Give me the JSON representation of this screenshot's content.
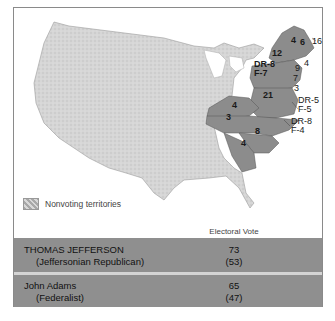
{
  "map": {
    "title": "Election of 1800 electoral map",
    "state_labels": [
      {
        "id": "nh",
        "text": "4",
        "x": 284,
        "y": 33
      },
      {
        "id": "me-ma",
        "text": "6",
        "x": 296,
        "y": 35
      },
      {
        "id": "ma",
        "text": "16",
        "x": 308,
        "y": 34
      },
      {
        "id": "ny",
        "text": "12",
        "x": 269,
        "y": 44
      },
      {
        "id": "ri",
        "text": "4",
        "x": 312,
        "y": 55
      },
      {
        "id": "ct",
        "text": "9",
        "x": 297,
        "y": 59
      },
      {
        "id": "pa",
        "text": "DR-8",
        "x": 258,
        "y": 63
      },
      {
        "id": "pa2",
        "text": "F-7",
        "x": 258,
        "y": 71
      },
      {
        "id": "nj",
        "text": "7",
        "x": 292,
        "y": 69
      },
      {
        "id": "de",
        "text": "3",
        "x": 290,
        "y": 80
      },
      {
        "id": "va",
        "text": "21",
        "x": 261,
        "y": 88
      },
      {
        "id": "md",
        "text": "DR-5",
        "x": 292,
        "y": 95
      },
      {
        "id": "md2",
        "text": "F-5",
        "x": 292,
        "y": 104
      },
      {
        "id": "ky",
        "text": "4",
        "x": 230,
        "y": 97
      },
      {
        "id": "tn",
        "text": "3",
        "x": 223,
        "y": 108
      },
      {
        "id": "nc",
        "text": "DR-8",
        "x": 285,
        "y": 117
      },
      {
        "id": "nc2",
        "text": "F-4",
        "x": 285,
        "y": 126
      },
      {
        "id": "sc",
        "text": "8",
        "x": 254,
        "y": 120
      },
      {
        "id": "ga",
        "text": "4",
        "x": 238,
        "y": 131
      }
    ]
  },
  "legend": {
    "swatch_icon": "hatched-swatch",
    "label": "Nonvoting territories"
  },
  "table": {
    "header_line1": "Electoral Vote",
    "header_line2": "(%)",
    "rows": [
      {
        "candidate": "THOMAS JEFFERSON",
        "party": "(Jeffersonian Republican)",
        "votes": "73",
        "percent": "(53)"
      },
      {
        "candidate": "John Adams",
        "party": "(Federalist)",
        "votes": "65",
        "percent": "(47)"
      }
    ]
  },
  "colors": {
    "voting_states": "#8c8c8c",
    "territory": "#d9d9d9",
    "table_row": "#8f8f8f"
  }
}
